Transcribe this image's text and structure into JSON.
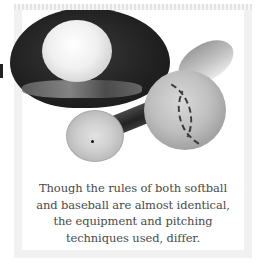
{
  "figure": {
    "photo_subject": "Softball in glove, baseball bat and worn baseball",
    "icons": {
      "glove": "baseball-glove-icon",
      "softball": "softball-icon",
      "baseball": "baseball-icon",
      "bat": "baseball-bat-icon"
    },
    "colors": {
      "caption_text": "#4a4a4a",
      "frame_background": "#f1f1f1",
      "page_background": "#ffffff"
    }
  },
  "caption": {
    "lines": [
      "Though the rules of both softball",
      "and baseball are almost identical,",
      "the equipment and pitching",
      "techniques used, differ."
    ]
  }
}
